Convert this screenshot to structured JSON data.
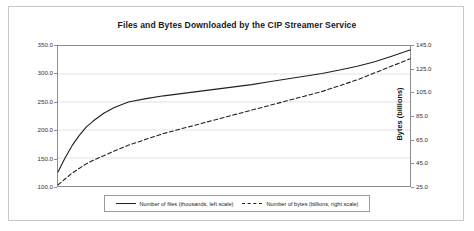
{
  "chart_data": {
    "type": "line",
    "title": "Files and Bytes Downloaded by the CIP Streamer Service",
    "xlabel": "",
    "ylabel": "Files (thousands)",
    "y2label": "Bytes (billions)",
    "grid": true,
    "legend_position": "bottom",
    "ylim": [
      100.0,
      350.0
    ],
    "y2lim": [
      25.0,
      145.0
    ],
    "yticks": [
      "100.0",
      "150.0",
      "200.0",
      "250.0",
      "300.0",
      "350.0"
    ],
    "y2ticks": [
      "25.0",
      "45.0",
      "65.0",
      "85.0",
      "105.0",
      "125.0",
      "145.0"
    ],
    "xticks": [],
    "x": [
      0,
      2,
      4,
      6,
      8,
      10,
      13,
      16,
      20,
      25,
      30,
      35,
      40,
      45,
      50,
      55,
      60,
      65,
      70,
      75,
      80,
      85,
      90,
      95,
      100
    ],
    "series": [
      {
        "name": "Number of files (thousands, left scale)",
        "axis": "left",
        "style": "solid",
        "color": "#202020",
        "values": [
          125,
          150,
          172,
          190,
          205,
          216,
          230,
          240,
          250,
          256,
          261,
          265,
          269,
          273,
          277,
          281,
          286,
          291,
          296,
          301,
          307,
          314,
          322,
          332,
          343
        ]
      },
      {
        "name": "Number of bytes (billions, right scale)",
        "axis": "right",
        "style": "dashed",
        "color": "#202020",
        "values": [
          26,
          31,
          36,
          40,
          44,
          47,
          51,
          55,
          60,
          65,
          70,
          74,
          78,
          82,
          86,
          90,
          94,
          98,
          102,
          106,
          111,
          116,
          122,
          128,
          134
        ]
      }
    ]
  },
  "legend": {
    "entries": [
      {
        "label": "Number of files (thousands, left scale)",
        "style": "solid"
      },
      {
        "label": "Number of bytes (billions, right scale)",
        "style": "dashed"
      }
    ]
  }
}
